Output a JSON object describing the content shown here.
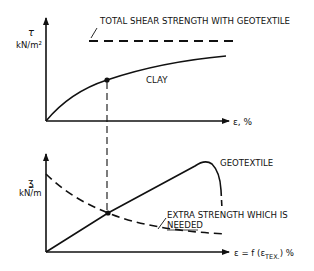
{
  "figure": {
    "top_panel": {
      "y_axis_symbol": "τ",
      "y_axis_unit": "kN/m²",
      "x_axis_label": "ε, %",
      "total_strength_label": "TOTAL SHEAR STRENGTH WITH GEOTEXTILE",
      "clay_label": "CLAY"
    },
    "bottom_panel": {
      "y_axis_symbol": "ʓ",
      "y_axis_unit": "kN/m",
      "x_axis_label_main": "ε = f (ε",
      "x_axis_label_sub": "TEX.",
      "x_axis_label_end": ") %",
      "geotextile_label": "GEOTEXTILE",
      "extra_strength_label_line1": "EXTRA STRENGTH WHICH IS",
      "extra_strength_label_line2": "NEEDED"
    },
    "colors": {
      "line": "#111111",
      "background": "#ffffff"
    }
  }
}
